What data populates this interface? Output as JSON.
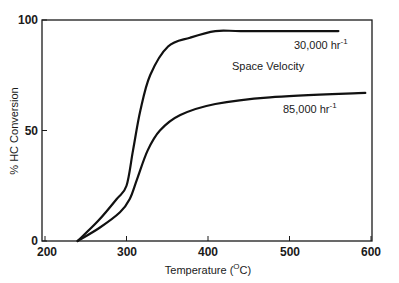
{
  "chart_data": {
    "type": "line",
    "title": "",
    "xlabel": "Temperature (°C)",
    "xlabel_parts": {
      "pre": "Temperature (",
      "sup": "O",
      "post": "C)"
    },
    "ylabel": "% HC Conversion",
    "xlim": [
      200,
      615
    ],
    "ylim": [
      0,
      100
    ],
    "x_ticks": [
      200,
      300,
      400,
      500,
      600
    ],
    "y_ticks": [
      0,
      50,
      100
    ],
    "grid": false,
    "legend_title": "Space Velocity",
    "series": [
      {
        "name": "30,000 hr-1",
        "label_main": "30,000 hr",
        "label_sup": "-1",
        "x": [
          240,
          265,
          288,
          300,
          308,
          317,
          329,
          351,
          378,
          409,
          440,
          500,
          560
        ],
        "values": [
          0,
          9,
          19,
          25,
          41,
          59,
          75,
          88,
          92,
          95,
          95,
          95,
          95
        ]
      },
      {
        "name": "85,000 hr-1",
        "label_main": "85,000 hr",
        "label_sup": "-1",
        "x": [
          240,
          267,
          292,
          304,
          313,
          326,
          341,
          366,
          409,
          476,
          593
        ],
        "values": [
          0,
          6,
          13,
          19,
          28,
          41,
          50,
          57,
          62,
          65,
          67
        ]
      }
    ]
  }
}
